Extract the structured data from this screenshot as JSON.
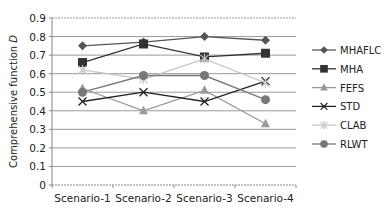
{
  "chart_data": {
    "type": "line",
    "title": "",
    "xlabel": "",
    "ylabel": "Comprehensive function D",
    "ylim": [
      0,
      0.9
    ],
    "yticks": [
      "0",
      "0.1",
      "0.2",
      "0.3",
      "0.4",
      "0.5",
      "0.6",
      "0.7",
      "0.8",
      "0.9"
    ],
    "grid": true,
    "legend_position": "right",
    "categories": [
      "Scenario-1",
      "Scenario-2",
      "Scenario-3",
      "Scenario-4"
    ],
    "series": [
      {
        "name": "MHAFLC",
        "marker": "diamond",
        "color": "#555555",
        "values": [
          0.75,
          0.77,
          0.8,
          0.78
        ]
      },
      {
        "name": "MHA",
        "marker": "square",
        "color": "#333333",
        "values": [
          0.66,
          0.76,
          0.69,
          0.71
        ]
      },
      {
        "name": "FEFS",
        "marker": "triangle",
        "color": "#999999",
        "values": [
          0.52,
          0.4,
          0.51,
          0.33
        ]
      },
      {
        "name": "STD",
        "marker": "x",
        "color": "#222222",
        "values": [
          0.45,
          0.5,
          0.45,
          0.56
        ]
      },
      {
        "name": "CLAB",
        "marker": "asterisk",
        "color": "#c8c8c8",
        "values": [
          0.62,
          0.57,
          0.68,
          0.55
        ]
      },
      {
        "name": "RLWT",
        "marker": "circle",
        "color": "#777777",
        "values": [
          0.5,
          0.59,
          0.59,
          0.46
        ]
      }
    ]
  }
}
